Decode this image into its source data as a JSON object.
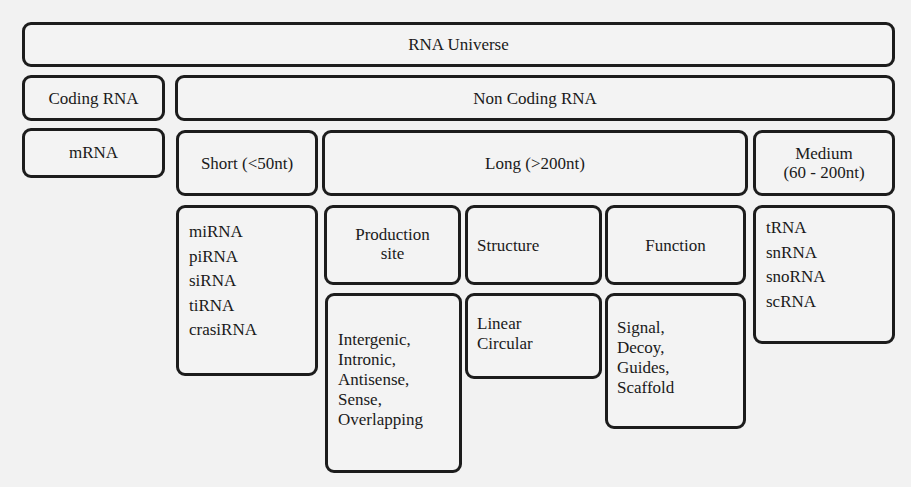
{
  "diagram": {
    "root": "RNA Universe",
    "coding": {
      "label": "Coding RNA",
      "child": "mRNA"
    },
    "noncoding": {
      "label": "Non Coding RNA",
      "short": {
        "label": "Short (<50nt)",
        "items": [
          "miRNA",
          "piRNA",
          "siRNA",
          "tiRNA",
          "crasiRNA"
        ]
      },
      "long": {
        "label": "Long (>200nt)",
        "categories": [
          {
            "label_line1": "Production",
            "label_line2": "site",
            "items": [
              "Intergenic,",
              "Intronic,",
              "Antisense,",
              "Sense,",
              "Overlapping"
            ]
          },
          {
            "label": "Structure",
            "items": [
              "Linear",
              "Circular"
            ]
          },
          {
            "label": "Function",
            "items": [
              "Signal,",
              "Decoy,",
              "Guides,",
              "Scaffold"
            ]
          }
        ]
      },
      "medium": {
        "label_line1": "Medium",
        "label_line2": "(60 - 200nt)",
        "items": [
          "tRNA",
          "snRNA",
          "snoRNA",
          "scRNA"
        ]
      }
    }
  }
}
